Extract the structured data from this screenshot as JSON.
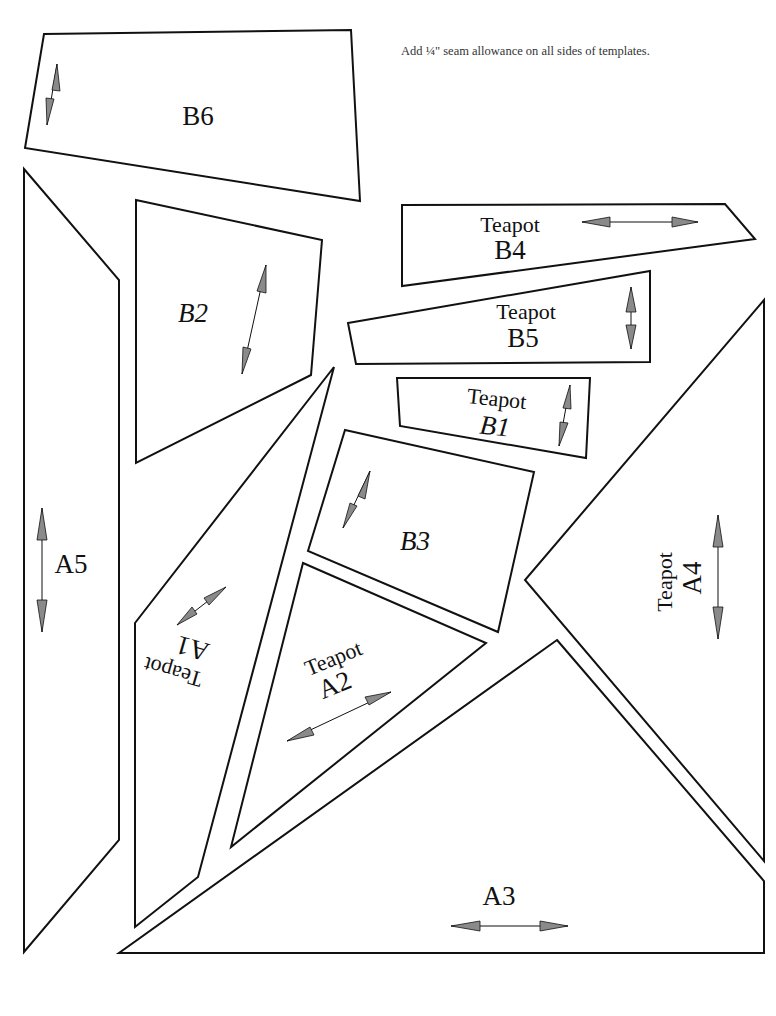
{
  "note": "Add ¼\" seam allowance on all sides of templates.",
  "colors": {
    "outline": "#111111",
    "arrow_fill": "#8a8a8a",
    "background": "#ffffff"
  },
  "pieces": {
    "B6": {
      "prefix": "",
      "name": "B6",
      "grain": "vertical"
    },
    "B2": {
      "prefix": "",
      "name": "B2",
      "grain": "vertical"
    },
    "B4": {
      "prefix": "Teapot",
      "name": "B4",
      "grain": "horizontal"
    },
    "B5": {
      "prefix": "Teapot",
      "name": "B5",
      "grain": "vertical"
    },
    "B1": {
      "prefix": "Teapot",
      "name": "B1",
      "grain": "vertical"
    },
    "B3": {
      "prefix": "",
      "name": "B3",
      "grain": "vertical"
    },
    "A5": {
      "prefix": "",
      "name": "A5",
      "grain": "vertical"
    },
    "A1": {
      "prefix": "Teapot",
      "name": "A1",
      "grain": "diagonal"
    },
    "A2": {
      "prefix": "Teapot",
      "name": "A2",
      "grain": "diagonal"
    },
    "A4": {
      "prefix": "Teapot",
      "name": "A4",
      "grain": "vertical"
    },
    "A3": {
      "prefix": "",
      "name": "A3",
      "grain": "horizontal"
    }
  }
}
